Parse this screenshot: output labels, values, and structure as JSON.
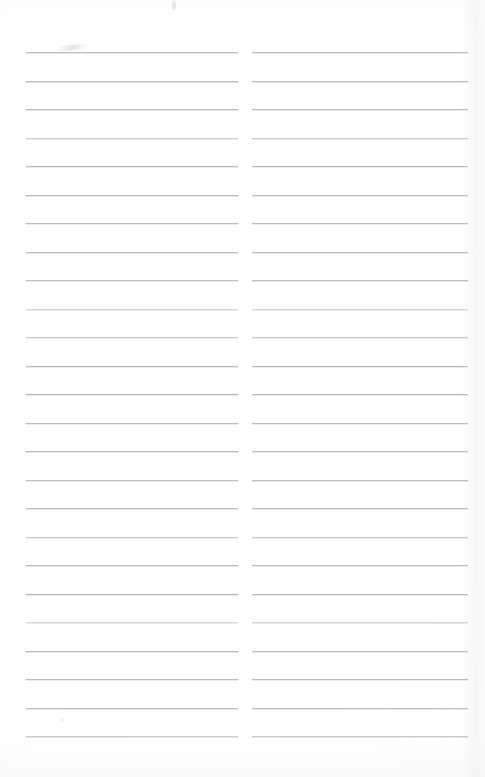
{
  "document": {
    "type": "scanned-lined-notebook-page",
    "title": "Blank ruled notebook page",
    "page_width": 485,
    "page_height": 777,
    "background_color": "#ffffff",
    "rule_color": "#b9bdc2",
    "rule_thickness_px": 1,
    "content_text": "",
    "columns": [
      {
        "name": "left-column",
        "x_start": 26,
        "x_end": 238,
        "line_count": 25,
        "first_line_y": 52,
        "line_spacing": 28.5,
        "text_values": [
          "",
          "",
          "",
          "",
          "",
          "",
          "",
          "",
          "",
          "",
          "",
          "",
          "",
          "",
          "",
          "",
          "",
          "",
          "",
          "",
          "",
          "",
          "",
          "",
          ""
        ]
      },
      {
        "name": "right-column",
        "x_start": 252,
        "x_end": 468,
        "line_count": 25,
        "first_line_y": 52,
        "line_spacing": 28.5,
        "text_values": [
          "",
          "",
          "",
          "",
          "",
          "",
          "",
          "",
          "",
          "",
          "",
          "",
          "",
          "",
          "",
          "",
          "",
          "",
          "",
          "",
          "",
          "",
          "",
          "",
          ""
        ]
      }
    ],
    "artifacts": [
      {
        "name": "top-speck",
        "x": 172,
        "y": 1,
        "width": 5,
        "height": 9
      },
      {
        "name": "first-line-smudge",
        "x": 58,
        "y": 45,
        "width": 28,
        "height": 6
      },
      {
        "name": "right-edge-shadow",
        "x": 463,
        "y": 0,
        "width": 22,
        "height": 777
      }
    ]
  }
}
